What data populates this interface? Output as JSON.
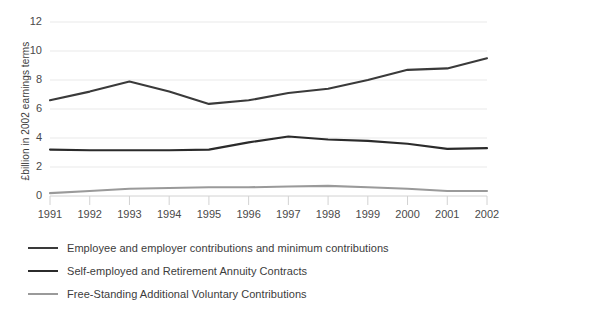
{
  "chart_data": {
    "type": "line",
    "title": "",
    "xlabel": "",
    "ylabel": "£billion in 2002 earnings terms",
    "categories": [
      "1991",
      "1992",
      "1993",
      "1994",
      "1995",
      "1996",
      "1997",
      "1998",
      "1999",
      "2000",
      "2001",
      "2002"
    ],
    "ylim": [
      0,
      12
    ],
    "yticks": [
      "0",
      "2",
      "4",
      "6",
      "8",
      "10",
      "12"
    ],
    "grid": "horizontal",
    "legend_position": "bottom-left",
    "series": [
      {
        "name": "Employee and employer contributions and minimum contributions",
        "color": "#3a3a3a",
        "values": [
          6.6,
          7.2,
          7.9,
          7.2,
          6.35,
          6.6,
          7.1,
          7.4,
          8.0,
          8.7,
          8.8,
          9.5
        ]
      },
      {
        "name": "Self-employed and Retirement Annuity Contracts",
        "color": "#2b2b2b",
        "values": [
          3.2,
          3.15,
          3.15,
          3.15,
          3.2,
          3.7,
          4.1,
          3.9,
          3.8,
          3.6,
          3.25,
          3.3
        ]
      },
      {
        "name": "Free-Standing Additional Voluntary Contributions",
        "color": "#9a9a9a",
        "values": [
          0.2,
          0.35,
          0.5,
          0.55,
          0.6,
          0.6,
          0.65,
          0.7,
          0.6,
          0.5,
          0.35,
          0.35
        ]
      }
    ]
  },
  "axes": {
    "y_title": "£billion in 2002 earnings terms"
  },
  "legend": {
    "items": [
      {
        "label": "Employee and employer contributions and minimum contributions"
      },
      {
        "label": "Self-employed and Retirement Annuity Contracts"
      },
      {
        "label": "Free-Standing Additional Voluntary Contributions"
      }
    ]
  }
}
